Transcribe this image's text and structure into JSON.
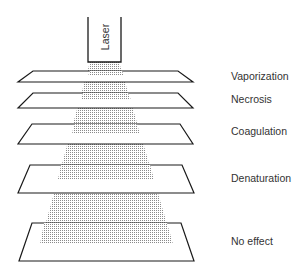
{
  "diagram": {
    "source_label": "Laser",
    "layers": [
      {
        "label": "Vaporization",
        "y": 70
      },
      {
        "label": "Necrosis",
        "y": 93
      },
      {
        "label": "Coagulation",
        "y": 125
      },
      {
        "label": "Denaturation",
        "y": 172
      },
      {
        "label": "No effect",
        "y": 235
      }
    ],
    "colors": {
      "line": "#1a1a1a",
      "beam": "#9a9a9a",
      "text": "#333333"
    }
  }
}
